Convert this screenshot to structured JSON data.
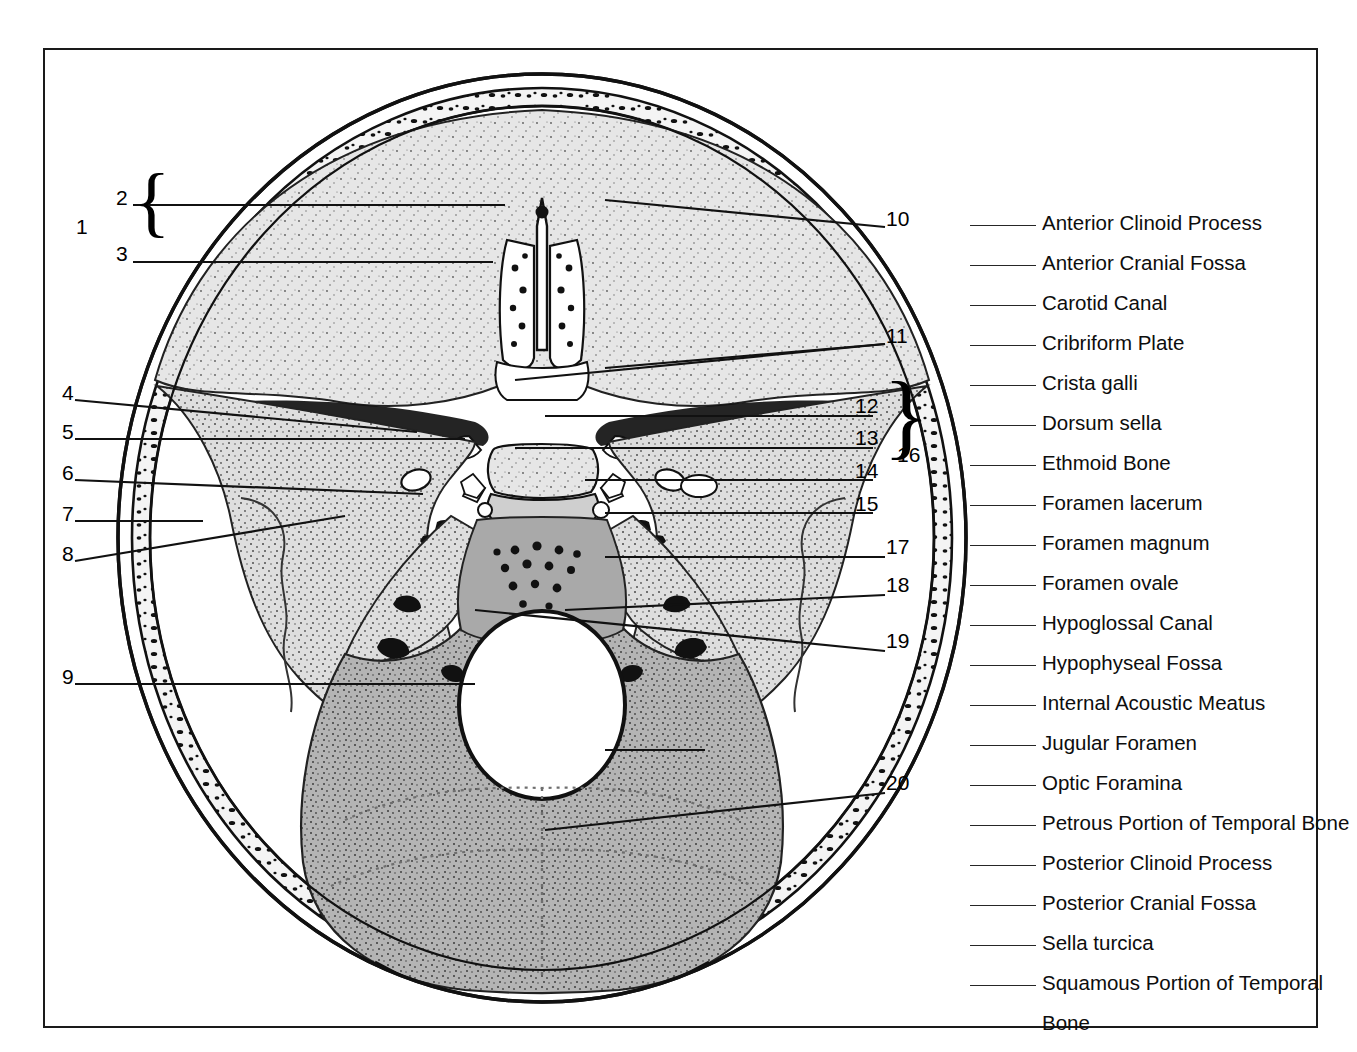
{
  "figure": {
    "frame_border_color": "#1a1a1a",
    "background_color": "#ffffff"
  },
  "left_numbers": [
    {
      "id": "n1",
      "text": "1",
      "x": 74,
      "y": 219
    },
    {
      "id": "n2",
      "text": "2",
      "x": 114,
      "y": 190
    },
    {
      "id": "n3",
      "text": "3",
      "x": 114,
      "y": 246
    },
    {
      "id": "n4",
      "text": "4",
      "x": 60,
      "y": 385
    },
    {
      "id": "n5",
      "text": "5",
      "x": 60,
      "y": 423
    },
    {
      "id": "n6",
      "text": "6",
      "x": 60,
      "y": 464
    },
    {
      "id": "n7",
      "text": "7",
      "x": 60,
      "y": 505
    },
    {
      "id": "n8",
      "text": "8",
      "x": 60,
      "y": 545
    },
    {
      "id": "n9",
      "text": "9",
      "x": 60,
      "y": 668
    }
  ],
  "right_numbers": [
    {
      "id": "n10",
      "text": "10",
      "x": 884,
      "y": 211
    },
    {
      "id": "n11",
      "text": "11",
      "x": 884,
      "y": 328
    },
    {
      "id": "n12",
      "text": "12",
      "x": 853,
      "y": 398
    },
    {
      "id": "n13",
      "text": "13",
      "x": 853,
      "y": 430
    },
    {
      "id": "n14",
      "text": "14",
      "x": 853,
      "y": 463
    },
    {
      "id": "n15",
      "text": "15",
      "x": 853,
      "y": 496
    },
    {
      "id": "n16",
      "text": "16",
      "x": 893,
      "y": 447
    },
    {
      "id": "n17",
      "text": "17",
      "x": 884,
      "y": 539
    },
    {
      "id": "n18",
      "text": "18",
      "x": 884,
      "y": 577
    },
    {
      "id": "n19",
      "text": "19",
      "x": 884,
      "y": 633
    },
    {
      "id": "n20",
      "text": "20",
      "x": 884,
      "y": 775
    }
  ],
  "braces": {
    "left_group": {
      "label": "1",
      "members": [
        "2",
        "3"
      ]
    },
    "right_group": {
      "label": "16",
      "members": [
        "12",
        "13",
        "14",
        "15"
      ]
    }
  },
  "legend": {
    "items": [
      {
        "label": "Anterior Clinoid Process"
      },
      {
        "label": "Anterior Cranial Fossa"
      },
      {
        "label": "Carotid Canal"
      },
      {
        "label": "Cribriform Plate"
      },
      {
        "label": "Crista galli"
      },
      {
        "label": "Dorsum sella"
      },
      {
        "label": "Ethmoid Bone"
      },
      {
        "label": "Foramen lacerum"
      },
      {
        "label": "Foramen magnum"
      },
      {
        "label": "Foramen ovale"
      },
      {
        "label": "Hypoglossal Canal"
      },
      {
        "label": "Hypophyseal Fossa"
      },
      {
        "label": "Internal Acoustic Meatus"
      },
      {
        "label": "Jugular Foramen"
      },
      {
        "label": "Optic Foramina"
      },
      {
        "label": "Petrous Portion of Temporal Bone"
      },
      {
        "label": "Posterior Clinoid Process"
      },
      {
        "label": "Posterior Cranial Fossa"
      },
      {
        "label": "Sella turcica"
      },
      {
        "label": "Squamous Portion of Temporal"
      },
      {
        "label": "Bone",
        "continuation": true
      }
    ]
  },
  "colors": {
    "outline": "#111111",
    "anterior_fossa_fill": "#e3e3e3",
    "middle_fossa_fill": "#dcdcdc",
    "posterior_fossa_fill": "#b5b5b5",
    "diploe_fill": "#f2f2f2",
    "foramen_magnum_fill": "#ffffff",
    "leader_line": "#111111"
  }
}
